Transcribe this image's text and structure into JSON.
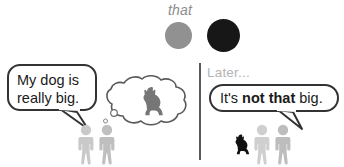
{
  "illustration": {
    "title_label": "that",
    "later_label": "Later...",
    "left_panel": {
      "speech_line_1": "My dog is",
      "speech_line_2": "really big.",
      "thought_content_icon": "dog-silhouette-icon",
      "people_icon": "two-person-figures-icon"
    },
    "right_panel": {
      "speech_prefix": "It's ",
      "speech_emphasis": "not that",
      "speech_suffix": " big.",
      "dog_icon": "small-dog-silhouette-icon",
      "people_icon": "two-person-figures-icon"
    },
    "referents": {
      "small_circle_label": "small-gray-circle",
      "large_circle_label": "large-black-circle"
    },
    "colors": {
      "small_circle": "#919191",
      "large_circle": "#171717",
      "outline": "#333333",
      "muted_text": "#8d8d8d",
      "later_text": "#b4b4b4",
      "figure_gray": "#c9c9c9",
      "thought_dog": "#767676",
      "small_dog": "#111111",
      "divider": "#5a5a5a",
      "background": "#ffffff"
    }
  }
}
